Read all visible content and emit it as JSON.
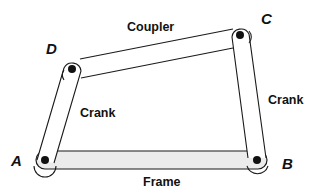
{
  "diagram": {
    "type": "four-bar linkage",
    "colors": {
      "stroke": "#1a1a1a",
      "frame_fill": "#ececec",
      "link_fill": "#ffffff",
      "pin": "#111111"
    },
    "joints": {
      "A": {
        "label": "A",
        "x": 45,
        "y": 160
      },
      "B": {
        "label": "B",
        "x": 257,
        "y": 160
      },
      "C": {
        "label": "C",
        "x": 240,
        "y": 35
      },
      "D": {
        "label": "D",
        "x": 72,
        "y": 69
      }
    },
    "links": {
      "coupler": {
        "label": "Coupler",
        "from": "D",
        "to": "C"
      },
      "crank_left": {
        "label": "Crank",
        "from": "A",
        "to": "D"
      },
      "crank_right": {
        "label": "Crank",
        "from": "B",
        "to": "C"
      },
      "frame": {
        "label": "Frame",
        "from": "A",
        "to": "B"
      }
    }
  }
}
